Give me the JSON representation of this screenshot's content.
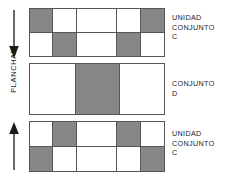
{
  "diagram": {
    "colors": {
      "fill_gray": "#878787",
      "fill_white": "#ffffff",
      "stroke": "#555555",
      "text": "#1a1a1a"
    },
    "axis": {
      "label": "PLANCHAR",
      "orientation": "vertical",
      "arrow_top": {
        "name": "arrow-down-icon",
        "direction": "down"
      },
      "arrow_bottom": {
        "name": "arrow-up-icon",
        "direction": "up"
      }
    },
    "blocks": [
      {
        "id": "block-1",
        "columns": [
          {
            "cells": [
              "gray",
              "white"
            ]
          },
          {
            "cells": [
              "white",
              "gray"
            ]
          },
          {
            "cells": [
              "white",
              "white"
            ]
          },
          {
            "cells": [
              "white",
              "gray"
            ]
          },
          {
            "cells": [
              "gray",
              "white"
            ]
          }
        ],
        "column_widths": [
          20,
          21,
          34,
          21,
          20
        ],
        "label": {
          "lines": [
            "UNIDAD",
            "CONJUNTO",
            "C"
          ]
        }
      },
      {
        "id": "block-2",
        "columns": [
          {
            "cells": [
              "white"
            ]
          },
          {
            "cells": [
              "gray"
            ]
          },
          {
            "cells": [
              "white"
            ]
          }
        ],
        "column_widths": [
          34,
          33,
          33
        ],
        "label": {
          "lines": [
            "CONJUNTO",
            "D"
          ]
        }
      },
      {
        "id": "block-3",
        "columns": [
          {
            "cells": [
              "white",
              "gray"
            ]
          },
          {
            "cells": [
              "gray",
              "white"
            ]
          },
          {
            "cells": [
              "white",
              "white"
            ]
          },
          {
            "cells": [
              "gray",
              "white"
            ]
          },
          {
            "cells": [
              "white",
              "gray"
            ]
          }
        ],
        "column_widths": [
          20,
          21,
          34,
          21,
          20
        ],
        "label": {
          "lines": [
            "UNIDAD",
            "CONJUNTO",
            "C"
          ]
        }
      }
    ]
  }
}
